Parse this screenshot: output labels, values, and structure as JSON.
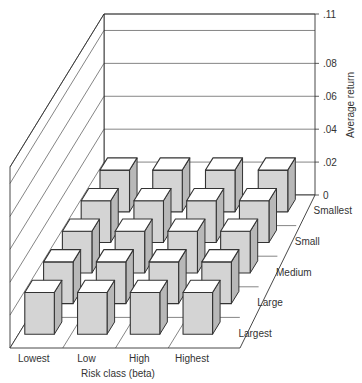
{
  "chart_data": {
    "type": "bar3d",
    "title": "",
    "xlabel": "Risk class (beta)",
    "ylabel": "Average return",
    "depth_label": "",
    "x_categories": [
      "Lowest",
      "Low",
      "High",
      "Highest"
    ],
    "depth_categories": [
      "Smallest",
      "Small",
      "Medium",
      "Large",
      "Largest"
    ],
    "z_ticks": [
      ".11",
      ".08",
      ".06",
      ".04",
      ".02",
      "0"
    ],
    "z_tick_values": [
      0.11,
      0.08,
      0.06,
      0.04,
      0.02,
      0
    ],
    "zlim": [
      0,
      0.11
    ],
    "grid": true,
    "values_note": "All bars are drawn at roughly equal small height; no per-bar value labels shown",
    "series": [
      {
        "name": "Smallest",
        "values": [
          0.012,
          0.012,
          0.012,
          0.012
        ]
      },
      {
        "name": "Small",
        "values": [
          0.012,
          0.012,
          0.012,
          0.012
        ]
      },
      {
        "name": "Medium",
        "values": [
          0.012,
          0.012,
          0.012,
          0.012
        ]
      },
      {
        "name": "Large",
        "values": [
          0.012,
          0.012,
          0.012,
          0.012
        ]
      },
      {
        "name": "Largest",
        "values": [
          0.012,
          0.012,
          0.012,
          0.012
        ]
      }
    ]
  },
  "colors": {
    "line": "#333333",
    "bar_top": "#ffffff",
    "bar_front": "#d4d4d4",
    "bar_side": "#b8b8b8",
    "wall": "#ffffff"
  }
}
